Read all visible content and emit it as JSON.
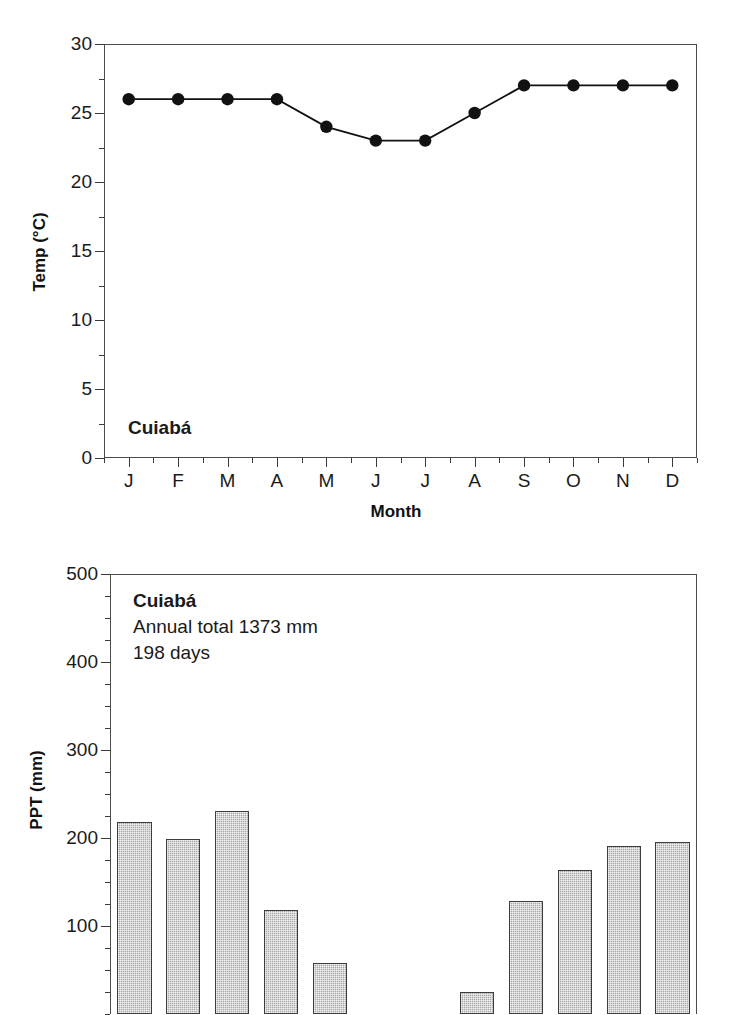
{
  "chart_data": [
    {
      "type": "line",
      "id": "temperature",
      "title": "Cuiabá",
      "xlabel": "Month",
      "ylabel": "Temp (°C)",
      "categories": [
        "J",
        "F",
        "M",
        "A",
        "M",
        "J",
        "J",
        "A",
        "S",
        "O",
        "N",
        "D"
      ],
      "values": [
        26,
        26,
        26,
        26,
        24,
        23,
        23,
        25,
        27,
        27,
        27,
        27
      ],
      "ylim": [
        0,
        30
      ],
      "ytick_labels": [
        "0",
        "5",
        "10",
        "15",
        "20",
        "25",
        "30"
      ],
      "ytick_values": [
        0,
        5,
        10,
        15,
        20,
        25,
        30
      ],
      "yminor_step": 2.5,
      "grid": false,
      "legend": "none",
      "marker": "filled-circle",
      "line_color": "#111111",
      "marker_color": "#111111"
    },
    {
      "type": "bar",
      "id": "precipitation",
      "title": "Cuiabá",
      "xlabel": "Month",
      "ylabel": "PPT (mm)",
      "categories": [
        "J",
        "F",
        "M",
        "A",
        "M",
        "J",
        "J",
        "A",
        "S",
        "O",
        "N",
        "D"
      ],
      "values": [
        218,
        199,
        231,
        118,
        58,
        0,
        0,
        25,
        128,
        164,
        191,
        195
      ],
      "ylim": [
        0,
        500
      ],
      "ytick_labels": [
        "100",
        "200",
        "300",
        "400",
        "500"
      ],
      "ytick_values": [
        100,
        200,
        300,
        400,
        500
      ],
      "yminor_step": 25,
      "grid": false,
      "legend": "none",
      "bar_fill": "#a8a8a8",
      "bar_edge": "#3d3d3d",
      "annotations": [
        "Cuiabá",
        "Annual total 1373 mm",
        "198 days"
      ],
      "note": "chart is cropped at the bottom edge of the image; baseline not visible"
    }
  ],
  "temp_chart": {
    "station_label": "Cuiabá",
    "y_axis_title": "Temp (°C)",
    "x_axis_title": "Month"
  },
  "ppt_chart": {
    "station_label": "Cuiabá",
    "annual_total": "Annual total 1373 mm",
    "rain_days": "198 days",
    "y_axis_title": "PPT (mm)"
  }
}
